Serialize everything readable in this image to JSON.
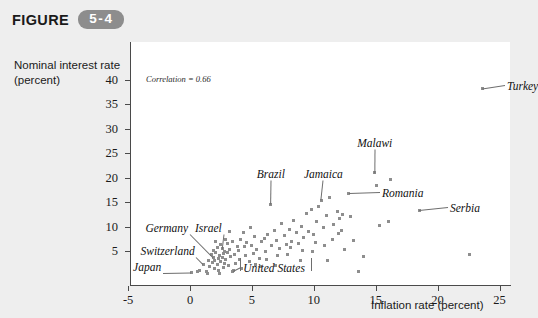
{
  "figure": {
    "label": "FIGURE",
    "number": "5-4",
    "badge_color": "#8d8d8d"
  },
  "axes": {
    "y_title": "Nominal interest rate (percent)",
    "x_title": "Inflation rate (percent)",
    "y_ticks": [
      "5",
      "10",
      "15",
      "20",
      "25",
      "30",
      "35",
      "40"
    ],
    "x_ticks": [
      "-5",
      "0",
      "5",
      "10",
      "15",
      "20",
      "25"
    ]
  },
  "annotation": {
    "correlation": "Correlation = 0.66"
  },
  "chart_data": {
    "type": "scatter",
    "title": "FIGURE 5-4",
    "xlabel": "Inflation rate (percent)",
    "ylabel": "Nominal interest rate (percent)",
    "xlim": [
      -5,
      26
    ],
    "ylim": [
      0,
      42
    ],
    "grid": false,
    "legend": "none",
    "marker_color": "#8e8e8e",
    "marker_shape": "square",
    "correlation": 0.66,
    "labeled_points": [
      {
        "name": "Japan",
        "x": 0.1,
        "y": 0.6,
        "label_x": -4.6,
        "label_y": 1.3
      },
      {
        "name": "Switzerland",
        "x": 1.1,
        "y": 2.3,
        "label_x": -4.0,
        "label_y": 4.6
      },
      {
        "name": "Germany",
        "x": 1.9,
        "y": 3.7,
        "label_x": -3.6,
        "label_y": 9.3
      },
      {
        "name": "Israel",
        "x": 2.6,
        "y": 5.6,
        "label_x": 0.4,
        "label_y": 9.4
      },
      {
        "name": "United States",
        "x": 3.5,
        "y": 1.0,
        "label_x": 4.3,
        "label_y": 1.2
      },
      {
        "name": "Brazil",
        "x": 6.5,
        "y": 14.6,
        "label_x": 5.4,
        "label_y": 20.4
      },
      {
        "name": "Jamaica",
        "x": 10.6,
        "y": 15.4,
        "label_x": 9.2,
        "label_y": 20.3
      },
      {
        "name": "Malawi",
        "x": 14.9,
        "y": 21.0,
        "label_x": 13.5,
        "label_y": 26.7
      },
      {
        "name": "Romania",
        "x": 12.8,
        "y": 16.8,
        "label_x": 15.5,
        "label_y": 16.4
      },
      {
        "name": "Serbia",
        "x": 18.5,
        "y": 13.3,
        "label_x": 21.0,
        "label_y": 13.3
      },
      {
        "name": "Turkey",
        "x": 23.6,
        "y": 38.2,
        "label_x": 25.6,
        "label_y": 38.3
      }
    ],
    "points": [
      [
        0.1,
        0.6
      ],
      [
        0.6,
        0.9
      ],
      [
        0.8,
        1.1
      ],
      [
        1.1,
        2.3
      ],
      [
        1.3,
        0.8
      ],
      [
        1.5,
        3.1
      ],
      [
        1.6,
        1.9
      ],
      [
        1.7,
        4.2
      ],
      [
        1.8,
        2.6
      ],
      [
        1.9,
        3.7
      ],
      [
        1.9,
        5.2
      ],
      [
        2.0,
        1.4
      ],
      [
        2.0,
        3.0
      ],
      [
        2.1,
        4.6
      ],
      [
        2.2,
        2.2
      ],
      [
        2.2,
        5.8
      ],
      [
        2.3,
        3.4
      ],
      [
        2.3,
        1.1
      ],
      [
        2.4,
        4.0
      ],
      [
        2.5,
        2.8
      ],
      [
        2.5,
        6.3
      ],
      [
        2.6,
        5.6
      ],
      [
        2.6,
        3.6
      ],
      [
        2.7,
        4.4
      ],
      [
        2.7,
        1.7
      ],
      [
        2.8,
        2.4
      ],
      [
        2.8,
        5.0
      ],
      [
        2.9,
        3.2
      ],
      [
        3.0,
        6.6
      ],
      [
        3.0,
        4.8
      ],
      [
        3.1,
        2.0
      ],
      [
        3.2,
        5.4
      ],
      [
        3.3,
        3.9
      ],
      [
        3.4,
        7.0
      ],
      [
        3.5,
        1.0
      ],
      [
        3.6,
        4.3
      ],
      [
        3.7,
        2.5
      ],
      [
        3.8,
        6.0
      ],
      [
        3.9,
        5.1
      ],
      [
        4.0,
        3.3
      ],
      [
        4.1,
        7.3
      ],
      [
        4.2,
        1.5
      ],
      [
        4.4,
        5.9
      ],
      [
        4.5,
        4.1
      ],
      [
        4.6,
        6.8
      ],
      [
        4.8,
        2.9
      ],
      [
        5.0,
        6.2
      ],
      [
        5.1,
        4.5
      ],
      [
        5.2,
        8.0
      ],
      [
        5.4,
        5.3
      ],
      [
        5.6,
        3.5
      ],
      [
        5.8,
        6.9
      ],
      [
        6.0,
        7.6
      ],
      [
        6.1,
        5.0
      ],
      [
        6.3,
        8.4
      ],
      [
        6.5,
        14.6
      ],
      [
        6.6,
        6.1
      ],
      [
        6.8,
        9.1
      ],
      [
        7.0,
        7.2
      ],
      [
        7.2,
        5.5
      ],
      [
        7.4,
        10.6
      ],
      [
        7.6,
        8.2
      ],
      [
        7.8,
        6.4
      ],
      [
        8.0,
        9.5
      ],
      [
        8.2,
        7.0
      ],
      [
        8.4,
        11.2
      ],
      [
        8.6,
        8.8
      ],
      [
        8.8,
        6.5
      ],
      [
        9.0,
        10.1
      ],
      [
        9.2,
        7.8
      ],
      [
        9.4,
        12.6
      ],
      [
        9.6,
        9.0
      ],
      [
        9.8,
        13.4
      ],
      [
        10.0,
        8.3
      ],
      [
        10.2,
        11.0
      ],
      [
        10.4,
        14.0
      ],
      [
        10.6,
        15.4
      ],
      [
        10.8,
        9.8
      ],
      [
        11.0,
        12.2
      ],
      [
        11.3,
        16.0
      ],
      [
        11.6,
        10.4
      ],
      [
        11.9,
        13.0
      ],
      [
        12.1,
        11.6
      ],
      [
        12.3,
        12.4
      ],
      [
        12.5,
        5.4
      ],
      [
        12.8,
        16.8
      ],
      [
        13.2,
        7.1
      ],
      [
        13.6,
        0.8
      ],
      [
        14.0,
        3.8
      ],
      [
        14.9,
        21.0
      ],
      [
        15.1,
        18.4
      ],
      [
        15.3,
        10.2
      ],
      [
        16.2,
        19.6
      ],
      [
        18.5,
        13.3
      ],
      [
        22.6,
        4.2
      ],
      [
        23.6,
        38.2
      ],
      [
        4.9,
        9.9
      ],
      [
        3.4,
        0.9
      ],
      [
        2.4,
        0.5
      ],
      [
        1.4,
        0.4
      ],
      [
        5.7,
        1.8
      ],
      [
        6.9,
        2.0
      ],
      [
        7.9,
        4.2
      ],
      [
        8.9,
        3.1
      ],
      [
        9.9,
        4.9
      ],
      [
        11.1,
        3.0
      ],
      [
        12.0,
        8.6
      ],
      [
        12.2,
        9.2
      ],
      [
        10.1,
        6.8
      ],
      [
        9.1,
        5.2
      ],
      [
        8.1,
        5.8
      ],
      [
        7.1,
        4.0
      ],
      [
        6.2,
        3.2
      ],
      [
        5.3,
        2.2
      ],
      [
        4.3,
        8.7
      ],
      [
        3.2,
        8.9
      ],
      [
        2.9,
        7.4
      ],
      [
        2.1,
        6.9
      ],
      [
        13.0,
        12.0
      ],
      [
        11.5,
        7.4
      ],
      [
        10.9,
        6.2
      ],
      [
        16.0,
        11.0
      ]
    ]
  }
}
